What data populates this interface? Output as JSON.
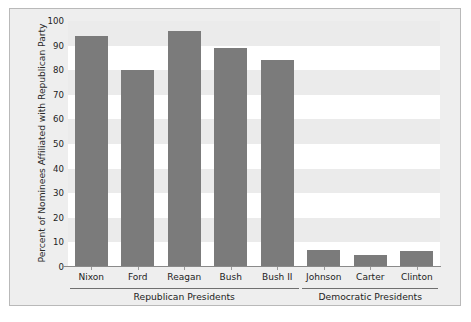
{
  "chart_data": {
    "type": "bar",
    "title": "",
    "subtitle": "",
    "xlabel": "",
    "ylabel": "Percent of Nominees Affiliated with Republican Party",
    "ylim": [
      0,
      100
    ],
    "ytick_labels": [
      "100",
      "90",
      "80",
      "70",
      "60",
      "50",
      "40",
      "30",
      "20",
      "10",
      "0"
    ],
    "ytick_values": [
      100,
      90,
      80,
      70,
      60,
      50,
      40,
      30,
      20,
      10,
      0
    ],
    "grid": "horizontal-alternating-bands",
    "legend": "none",
    "bar_color": "#7b7b7b",
    "plot_background": "#ffffff",
    "band_color": "#ebebeb",
    "figure_background": "#eeeeee",
    "categories": [
      "Nixon",
      "Ford",
      "Reagan",
      "Bush",
      "Bush II",
      "Johnson",
      "Carter",
      "Clinton"
    ],
    "values": [
      94,
      80,
      96,
      89,
      84,
      7,
      5,
      6.5
    ],
    "groups": [
      {
        "label": "Republican Presidents",
        "categories": [
          "Nixon",
          "Ford",
          "Reagan",
          "Bush",
          "Bush II"
        ]
      },
      {
        "label": "Democratic Presidents",
        "categories": [
          "Johnson",
          "Carter",
          "Clinton"
        ]
      }
    ]
  }
}
